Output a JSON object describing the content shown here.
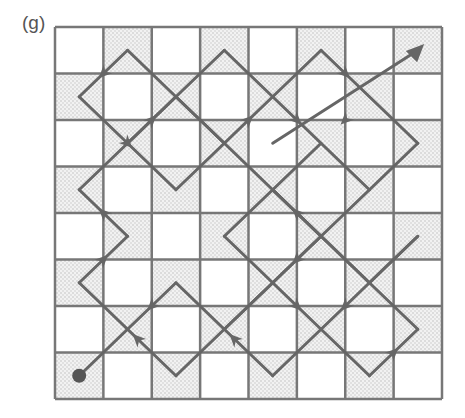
{
  "figure": {
    "label": "(g)",
    "grid": {
      "rows": 8,
      "cols": 8,
      "shaded_parity": "odd"
    },
    "colors": {
      "line": "#666666",
      "shade": "#d8d8d8",
      "dot": "#555555"
    },
    "start_marker": "filled-circle",
    "end_marker": "arrowhead",
    "segments": [
      [
        [
          0.5,
          7.5
        ],
        [
          2.5,
          5.5
        ]
      ],
      [
        [
          2.5,
          5.5
        ],
        [
          4.5,
          7.5
        ]
      ],
      [
        [
          4.5,
          7.5
        ],
        [
          7.5,
          4.5
        ]
      ],
      [
        [
          7.5,
          4.5
        ],
        [
          6.5,
          5.5
        ]
      ],
      [
        [
          6.5,
          5.5
        ],
        [
          4.5,
          3.5
        ]
      ],
      [
        [
          0.5,
          5.5
        ],
        [
          2.5,
          7.5
        ]
      ],
      [
        [
          2.5,
          7.5
        ],
        [
          5.5,
          4.5
        ]
      ],
      [
        [
          5.5,
          4.5
        ],
        [
          3.5,
          2.5
        ]
      ],
      [
        [
          0.5,
          5.5
        ],
        [
          1.5,
          4.5
        ]
      ],
      [
        [
          1.5,
          4.5
        ],
        [
          0.5,
          3.5
        ]
      ],
      [
        [
          0.5,
          3.5
        ],
        [
          2.5,
          1.5
        ]
      ],
      [
        [
          2.5,
          1.5
        ],
        [
          3.5,
          2.5
        ]
      ],
      [
        [
          3.5,
          2.5
        ],
        [
          5.5,
          0.5
        ]
      ],
      [
        [
          5.5,
          0.5
        ],
        [
          7.5,
          2.5
        ]
      ],
      [
        [
          7.5,
          2.5
        ],
        [
          6.5,
          3.5
        ]
      ],
      [
        [
          6.5,
          3.5
        ],
        [
          3.5,
          6.5
        ]
      ],
      [
        [
          3.5,
          4.5
        ],
        [
          6.5,
          7.5
        ]
      ],
      [
        [
          6.5,
          7.5
        ],
        [
          7.5,
          6.5
        ]
      ],
      [
        [
          7.5,
          6.5
        ],
        [
          4.5,
          3.5
        ]
      ],
      [
        [
          3.5,
          4.5
        ],
        [
          5.5,
          2.5
        ]
      ],
      [
        [
          0.5,
          1.5
        ],
        [
          1.5,
          0.5
        ]
      ],
      [
        [
          1.5,
          0.5
        ],
        [
          3.5,
          2.5
        ]
      ],
      [
        [
          0.5,
          1.5
        ],
        [
          2.5,
          3.5
        ]
      ],
      [
        [
          2.5,
          3.5
        ],
        [
          3.5,
          2.5
        ]
      ],
      [
        [
          1.5,
          2.5
        ],
        [
          3.5,
          0.5
        ]
      ],
      [
        [
          3.5,
          0.5
        ],
        [
          6.5,
          3.5
        ]
      ],
      [
        [
          4.5,
          2.5
        ],
        [
          7.5,
          -0.5
        ]
      ]
    ],
    "arrows": [
      {
        "at": [
          1,
          1
        ],
        "dir": "down-left"
      },
      {
        "at": [
          1.5,
          2.5
        ],
        "dir": "down-right"
      },
      {
        "at": [
          2,
          2
        ],
        "dir": "up-right"
      },
      {
        "at": [
          4,
          2
        ],
        "dir": "up-right"
      },
      {
        "at": [
          6,
          1
        ],
        "dir": "down-right"
      },
      {
        "at": [
          5,
          2
        ],
        "dir": "down-right"
      },
      {
        "at": [
          6,
          2
        ],
        "dir": "down-left"
      },
      {
        "at": [
          1,
          4
        ],
        "dir": "up-left"
      },
      {
        "at": [
          1,
          5
        ],
        "dir": "up-right"
      },
      {
        "at": [
          5,
          4
        ],
        "dir": "up-left"
      },
      {
        "at": [
          5,
          5
        ],
        "dir": "down-left"
      },
      {
        "at": [
          2,
          6
        ],
        "dir": "down-left"
      },
      {
        "at": [
          1.7,
          6.7
        ],
        "dir": "up-left"
      },
      {
        "at": [
          5,
          6
        ],
        "dir": "down-right"
      },
      {
        "at": [
          6,
          6
        ],
        "dir": "down-left"
      },
      {
        "at": [
          3.7,
          6.7
        ],
        "dir": "up-left"
      },
      {
        "at": [
          7,
          7
        ],
        "dir": "up-right"
      },
      {
        "at": [
          7.5,
          0.5
        ],
        "dir": "up-right"
      }
    ]
  }
}
